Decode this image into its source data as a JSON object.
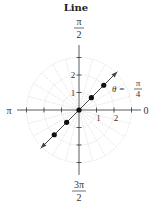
{
  "title": "Line",
  "chart_data": {
    "type": "polar-line",
    "title": "Line",
    "equation_label": {
      "lhs": "θ =",
      "num": "π",
      "den": "4"
    },
    "theta": 0.7853981634,
    "center_px": [
      79,
      110
    ],
    "unit_px": 17.5,
    "grid": {
      "circles": [
        1,
        2,
        3
      ],
      "radial_step_deg": 15,
      "style": "dotted",
      "color": "#c8c8c8"
    },
    "axis_ticks": [
      -3,
      -2,
      -1,
      1,
      2,
      3
    ],
    "radial_tick_labels": [
      {
        "value": "1",
        "axis": "horizontal"
      },
      {
        "value": "2",
        "axis": "horizontal"
      },
      {
        "value": "1",
        "axis": "vertical"
      },
      {
        "value": "2",
        "axis": "vertical"
      }
    ],
    "angle_labels": {
      "right": "0",
      "top": {
        "num": "π",
        "den": "2"
      },
      "left": "π",
      "bottom": {
        "num": "3π",
        "den": "2"
      }
    },
    "points_r": [
      -2,
      -1,
      0,
      1,
      2
    ],
    "line_extent_r": [
      -3.1,
      3.1
    ],
    "colors": {
      "line": "#444444",
      "point": "#111111",
      "axis": "#333333",
      "grid": "#c8c8c8"
    }
  }
}
